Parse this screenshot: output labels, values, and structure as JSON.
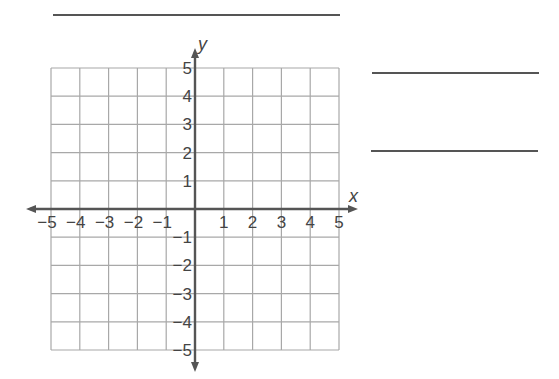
{
  "answer_lines": [
    {
      "id": "top-line",
      "x1": 53,
      "x2": 340,
      "y": 14
    },
    {
      "id": "right-line-1",
      "x1": 372,
      "x2": 539,
      "y": 72
    },
    {
      "id": "right-line-2",
      "x1": 371,
      "x2": 538,
      "y": 150
    }
  ],
  "chart_data": {
    "type": "scatter",
    "title": "",
    "xlabel": "x",
    "ylabel": "y",
    "xlim": [
      -5,
      5
    ],
    "ylim": [
      -5,
      5
    ],
    "grid": true,
    "x_ticks": [
      "-5",
      "-4",
      "-3",
      "-2",
      "-1",
      "1",
      "2",
      "3",
      "4",
      "5"
    ],
    "y_ticks": [
      "5",
      "4",
      "3",
      "2",
      "1",
      "-1",
      "-2",
      "-3",
      "-4",
      "-5"
    ],
    "points": [],
    "legend": []
  },
  "axes": {
    "x_label": "x",
    "y_label": "y",
    "x_tick_labels": [
      "−5",
      "−4",
      "−3",
      "−2",
      "−1",
      "1",
      "2",
      "3",
      "4",
      "5"
    ],
    "y_tick_labels": [
      "5",
      "4",
      "3",
      "2",
      "1",
      "−1",
      "−2",
      "−3",
      "−4",
      "−5"
    ]
  },
  "colors": {
    "grid": "#a8a8a8",
    "axis": "#555555",
    "text": "#444444"
  }
}
